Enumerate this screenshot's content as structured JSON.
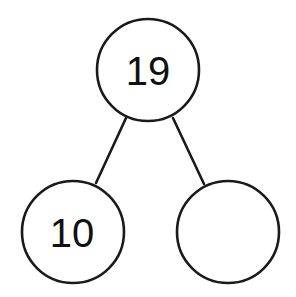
{
  "diagram": {
    "type": "number-bond",
    "stroke_color": "#1a1a1a",
    "background": "#ffffff",
    "nodes": [
      {
        "id": "whole",
        "label": "19",
        "cx": 148,
        "cy": 70,
        "r": 51
      },
      {
        "id": "part-left",
        "label": "10",
        "cx": 73,
        "cy": 232,
        "r": 51
      },
      {
        "id": "part-right",
        "label": "",
        "cx": 228,
        "cy": 232,
        "r": 51
      }
    ],
    "edges": [
      {
        "from": "whole",
        "to": "part-left",
        "x1": 126,
        "y1": 118,
        "x2": 96,
        "y2": 183
      },
      {
        "from": "whole",
        "to": "part-right",
        "x1": 173,
        "y1": 118,
        "x2": 204,
        "y2": 184
      }
    ]
  }
}
